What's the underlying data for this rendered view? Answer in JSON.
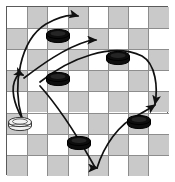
{
  "figure": {
    "kind": "checkers-board-diagram",
    "board": {
      "rows": 8,
      "cols": 8,
      "light_color": "#ffffff",
      "dark_color": "#c9c9c9",
      "grid_line_color": "#8d8d8d",
      "border_color": "#5a5a5a",
      "origin_x": 6,
      "origin_y": 6,
      "cell_w": 20.2,
      "cell_h": 21.1
    },
    "pieces": [
      {
        "id": "black-1",
        "color": "black",
        "label": "black-checker",
        "col": 2,
        "row": 1,
        "cx": 58,
        "cy": 36
      },
      {
        "id": "black-2",
        "color": "black",
        "label": "black-checker",
        "col": 5,
        "row": 2,
        "cx": 118,
        "cy": 58
      },
      {
        "id": "black-3",
        "color": "black",
        "label": "black-checker",
        "col": 2,
        "row": 3,
        "cx": 58,
        "cy": 79
      },
      {
        "id": "white-1",
        "color": "white",
        "label": "white-checker",
        "col": 0,
        "row": 5,
        "cx": 20,
        "cy": 124
      },
      {
        "id": "black-4",
        "color": "black",
        "label": "black-checker",
        "col": 6,
        "row": 5,
        "cx": 139,
        "cy": 122
      },
      {
        "id": "black-5",
        "color": "black",
        "label": "black-checker",
        "col": 3,
        "row": 6,
        "cx": 79,
        "cy": 143
      }
    ],
    "piece_colors": {
      "black_fill": "#0d0d0d",
      "black_edge": "#000000",
      "white_fill": "#f2f2f2",
      "white_edge": "#3a3a3a",
      "arrow_color": "#111111"
    },
    "arrows": [
      {
        "id": "arrow-1",
        "name": "jump-path-to-top",
        "from": [
          22,
          118
        ],
        "to": [
          80,
          16
        ],
        "path": "M22,118 C12,86 20,40 46,24 C60,16 70,14 78,16"
      },
      {
        "id": "arrow-2",
        "name": "jump-path-to-upper-left",
        "from": [
          22,
          118
        ],
        "to": [
          24,
          75
        ],
        "path": "M22,118 C14,104 10,88 16,78 C18,74 21,74 23,75"
      },
      {
        "id": "arrow-3",
        "name": "jump-path-to-upper-middle",
        "from": [
          24,
          78
        ],
        "to": [
          96,
          40
        ],
        "path": "M24,78 C40,66 64,48 88,41 C91,40 94,40 96,40"
      },
      {
        "id": "arrow-4",
        "name": "jump-path-to-right-edge",
        "from": [
          40,
          82
        ],
        "to": [
          155,
          106
        ],
        "path": "M40,82 C70,58 112,42 142,56 C156,64 158,88 155,104"
      },
      {
        "id": "arrow-5",
        "name": "jump-path-to-bottom",
        "from": [
          40,
          86
        ],
        "to": [
          97,
          169
        ],
        "path": "M40,86 C58,106 76,134 92,162 C94,166 96,168 97,168"
      },
      {
        "id": "arrow-6",
        "name": "jump-path-bottom-to-right",
        "from": [
          97,
          169
        ],
        "to": [
          155,
          104
        ],
        "path": "M97,168 C104,146 118,124 140,114 C147,110 152,107 155,105"
      }
    ]
  }
}
